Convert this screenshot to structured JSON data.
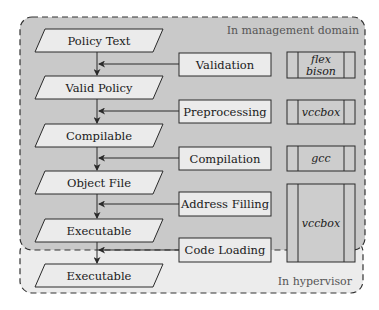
{
  "diagram": {
    "colors": {
      "management_fill": "#c9c9c9",
      "hypervisor_fill": "#ececec",
      "node_fill": "#ebebeb",
      "tool_fill": "#cdcdcd",
      "stroke": "#2a2a2a",
      "domain_label": "#555555"
    },
    "domains": {
      "management": {
        "label": "In management domain"
      },
      "hypervisor": {
        "label": "In hypervisor"
      }
    },
    "artifacts": [
      {
        "id": "policy-text",
        "label": "Policy Text"
      },
      {
        "id": "valid-policy",
        "label": "Valid Policy"
      },
      {
        "id": "compilable",
        "label": "Compilable"
      },
      {
        "id": "object-file",
        "label": "Object File"
      },
      {
        "id": "executable-mgmt",
        "label": "Executable"
      },
      {
        "id": "executable-hyp",
        "label": "Executable"
      }
    ],
    "processes": [
      {
        "id": "validation",
        "label": "Validation"
      },
      {
        "id": "preprocessing",
        "label": "Preprocessing"
      },
      {
        "id": "compilation",
        "label": "Compilation"
      },
      {
        "id": "address-filling",
        "label": "Address Filling"
      },
      {
        "id": "code-loading",
        "label": "Code Loading"
      }
    ],
    "tools": [
      {
        "id": "flex-bison",
        "line1": "flex",
        "line2": "bison"
      },
      {
        "id": "vccbox-1",
        "label": "vccbox"
      },
      {
        "id": "gcc",
        "label": "gcc"
      },
      {
        "id": "vccbox-2",
        "label": "vccbox"
      }
    ]
  }
}
